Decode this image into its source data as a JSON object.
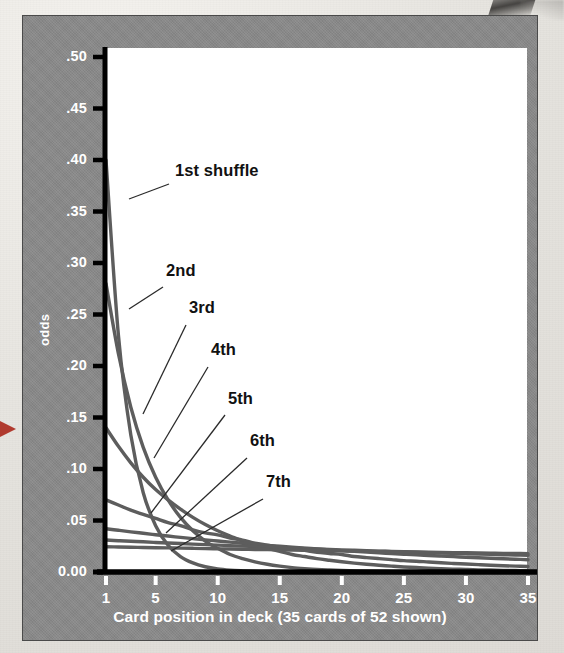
{
  "figure": {
    "background_color": "#e9e7e2",
    "panel_color": "#898989",
    "plot_background": "#ffffff",
    "axis_color": "#000000",
    "curve_color": "#5d5d5d",
    "label_color": "#111111",
    "tick_text_color": "#ffffff"
  },
  "chart_data": {
    "type": "line",
    "title": "",
    "xlabel": "Card position in deck (35 cards of 52 shown)",
    "ylabel": "odds",
    "xlim": [
      1,
      35
    ],
    "ylim": [
      0.0,
      0.52
    ],
    "grid": false,
    "legend_position": "inline-annotations",
    "xticks": [
      1,
      5,
      10,
      15,
      20,
      25,
      30,
      35
    ],
    "xticklabels": [
      "1",
      "5",
      "10",
      "15",
      "20",
      "25",
      "30",
      "35"
    ],
    "yticks": [
      0.0,
      0.05,
      0.1,
      0.15,
      0.2,
      0.25,
      0.3,
      0.35,
      0.4,
      0.45,
      0.5
    ],
    "yticklabels": [
      "0.00",
      ".05",
      ".10",
      ".15",
      ".20",
      ".25",
      ".30",
      ".35",
      ".40",
      ".45",
      ".50"
    ],
    "x": [
      1,
      2,
      3,
      4,
      5,
      6,
      7,
      8,
      9,
      10,
      11,
      12,
      13,
      14,
      15,
      16,
      17,
      18,
      19,
      20,
      21,
      22,
      23,
      24,
      25,
      26,
      27,
      28,
      29,
      30,
      31,
      32,
      33,
      34,
      35
    ],
    "series": [
      {
        "name": "1st shuffle",
        "label": "1st shuffle",
        "values": [
          0.4,
          0.23,
          0.133,
          0.077,
          0.045,
          0.026,
          0.015,
          0.0088,
          0.0051,
          0.003,
          0.0018,
          0.0011,
          0.0006,
          0.0,
          0,
          0,
          0,
          0,
          0,
          0,
          0,
          0,
          0,
          0,
          0,
          0,
          0,
          0,
          0,
          0,
          0,
          0,
          0,
          0,
          0
        ]
      },
      {
        "name": "2nd",
        "label": "2nd",
        "values": [
          0.28,
          0.212,
          0.16,
          0.121,
          0.092,
          0.07,
          0.053,
          0.04,
          0.03,
          0.023,
          0.017,
          0.013,
          0.0099,
          0.0075,
          0.0057,
          0.0043,
          0.0033,
          0.0025,
          0.0019,
          0.0014,
          0.0011,
          0.0008,
          0.0006,
          0.0004,
          0.0003,
          0.0,
          0,
          0,
          0,
          0,
          0,
          0,
          0,
          0,
          0
        ]
      },
      {
        "name": "3rd",
        "label": "3rd",
        "values": [
          0.14,
          0.122,
          0.106,
          0.092,
          0.08,
          0.07,
          0.061,
          0.053,
          0.046,
          0.04,
          0.035,
          0.03,
          0.026,
          0.023,
          0.02,
          0.017,
          0.015,
          0.013,
          0.0114,
          0.0099,
          0.0086,
          0.0075,
          0.0065,
          0.0057,
          0.0049,
          0.0043,
          0.0037,
          0.0032,
          0.0028,
          0.0025,
          0.0021,
          0.0019,
          0.0016,
          0.0014,
          0.0012
        ]
      },
      {
        "name": "4th",
        "label": "4th",
        "values": [
          0.07,
          0.065,
          0.06,
          0.056,
          0.052,
          0.048,
          0.045,
          0.041,
          0.038,
          0.036,
          0.033,
          0.031,
          0.028,
          0.026,
          0.024,
          0.023,
          0.021,
          0.019,
          0.018,
          0.017,
          0.015,
          0.014,
          0.013,
          0.012,
          0.011,
          0.0105,
          0.0097,
          0.009,
          0.0083,
          0.0077,
          0.0072,
          0.0066,
          0.0061,
          0.0057,
          0.0053
        ]
      },
      {
        "name": "5th",
        "label": "5th",
        "values": [
          0.042,
          0.0405,
          0.039,
          0.0376,
          0.0362,
          0.0349,
          0.0336,
          0.0324,
          0.0312,
          0.0301,
          0.029,
          0.0279,
          0.0269,
          0.0259,
          0.025,
          0.0241,
          0.0232,
          0.0224,
          0.0215,
          0.0208,
          0.02,
          0.0193,
          0.0186,
          0.0179,
          0.0173,
          0.0166,
          0.016,
          0.0154,
          0.0149,
          0.0143,
          0.0138,
          0.0133,
          0.0128,
          0.0124,
          0.0119
        ]
      },
      {
        "name": "6th",
        "label": "6th",
        "values": [
          0.031,
          0.0304,
          0.0298,
          0.0293,
          0.0287,
          0.0282,
          0.0276,
          0.0271,
          0.0266,
          0.0261,
          0.0256,
          0.0251,
          0.0246,
          0.0241,
          0.0237,
          0.0232,
          0.0228,
          0.0224,
          0.0219,
          0.0215,
          0.0211,
          0.0207,
          0.0203,
          0.0199,
          0.0196,
          0.0192,
          0.0188,
          0.0185,
          0.0181,
          0.0178,
          0.0174,
          0.0171,
          0.0168,
          0.0165,
          0.0162
        ]
      },
      {
        "name": "7th",
        "label": "7th",
        "values": [
          0.0245,
          0.0243,
          0.0241,
          0.0238,
          0.0236,
          0.0234,
          0.0232,
          0.023,
          0.0227,
          0.0225,
          0.0223,
          0.0221,
          0.0219,
          0.0217,
          0.0215,
          0.0213,
          0.0211,
          0.0209,
          0.0207,
          0.0205,
          0.0203,
          0.0201,
          0.0199,
          0.0198,
          0.0196,
          0.0194,
          0.0192,
          0.019,
          0.0188,
          0.0187,
          0.0185,
          0.0183,
          0.0181,
          0.018,
          0.0178
        ]
      }
    ],
    "annotations": [
      {
        "text": "1st shuffle",
        "label_x": 152,
        "label_y": 157,
        "leader_from_x": 146,
        "leader_from_y": 168,
        "leader_to_x": 106,
        "leader_to_y": 183
      },
      {
        "text": "2nd",
        "label_x": 143,
        "label_y": 257,
        "leader_from_x": 140,
        "leader_from_y": 271,
        "leader_to_x": 106,
        "leader_to_y": 293
      },
      {
        "text": "3rd",
        "label_x": 166,
        "label_y": 294,
        "leader_from_x": 163,
        "leader_from_y": 309,
        "leader_to_x": 120,
        "leader_to_y": 398
      },
      {
        "text": "4th",
        "label_x": 188,
        "label_y": 336,
        "leader_from_x": 185,
        "leader_from_y": 351,
        "leader_to_x": 131,
        "leader_to_y": 442
      },
      {
        "text": "5th",
        "label_x": 205,
        "label_y": 385,
        "leader_from_x": 202,
        "leader_from_y": 399,
        "leader_to_x": 128,
        "leader_to_y": 497
      },
      {
        "text": "6th",
        "label_x": 227,
        "label_y": 427,
        "leader_from_x": 224,
        "leader_from_y": 442,
        "leader_to_x": 143,
        "leader_to_y": 517
      },
      {
        "text": "7th",
        "label_x": 243,
        "label_y": 468,
        "leader_from_x": 240,
        "leader_from_y": 483,
        "leader_to_x": 148,
        "leader_to_y": 535
      }
    ]
  }
}
